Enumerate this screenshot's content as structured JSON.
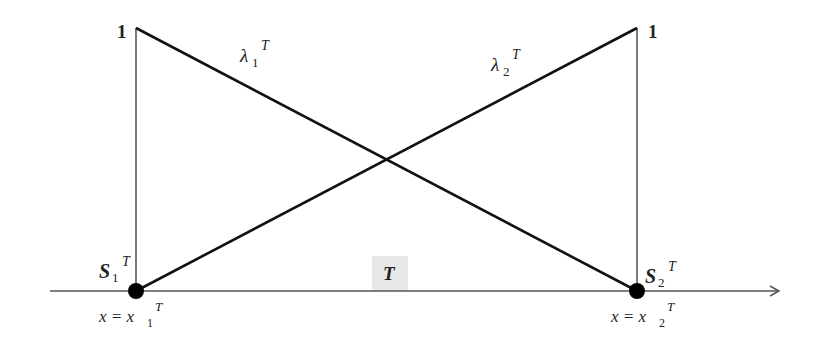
{
  "diagram": {
    "type": "linear shape functions on element T",
    "colors": {
      "line": "#111111",
      "axis": "#444444",
      "element_box": "#e6e6e6"
    },
    "top_labels": {
      "left": "1",
      "right": "1"
    },
    "functions": [
      {
        "symbol": "λ",
        "subscript": "1",
        "superscript": "T",
        "from": "top-left",
        "to": "bottom-right"
      },
      {
        "symbol": "λ",
        "subscript": "2",
        "superscript": "T",
        "from": "bottom-left",
        "to": "top-right"
      }
    ],
    "nodes": [
      {
        "label": "S",
        "subscript": "1",
        "superscript": "T",
        "coord_label": "x = x",
        "coord_sub": "1",
        "coord_sup": "T"
      },
      {
        "label": "S",
        "subscript": "2",
        "superscript": "T",
        "coord_label": "x = x",
        "coord_sub": "2",
        "coord_sup": "T"
      }
    ],
    "element_label": "T"
  }
}
